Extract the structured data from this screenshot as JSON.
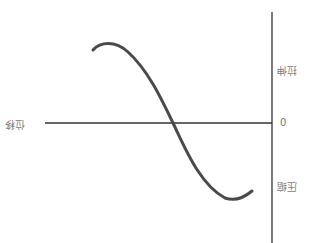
{
  "diagram": {
    "orientation": "rotated 180 degrees",
    "labels": {
      "horizontal_axis": "位移",
      "upper_region": "拉伸",
      "lower_region": "压缩",
      "origin": "0"
    },
    "colors": {
      "axis": "#333333",
      "curve": "#4a4a4a",
      "label": "#7a7a7a"
    }
  }
}
